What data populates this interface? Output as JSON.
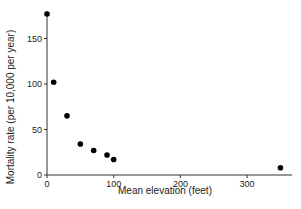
{
  "chart_data": {
    "type": "scatter",
    "title": "",
    "xlabel": "Mean elevation (feet)",
    "ylabel": "Mortality rate (per 10,000 per year)",
    "x": [
      0,
      10,
      30,
      50,
      70,
      90,
      100,
      350
    ],
    "y": [
      177,
      102,
      65,
      34,
      27,
      22,
      17,
      8
    ],
    "xlim": [
      0,
      360
    ],
    "ylim": [
      0,
      180
    ],
    "x_ticks": [
      0,
      100,
      200,
      300
    ],
    "y_ticks": [
      0,
      50,
      100,
      150
    ],
    "grid": false,
    "legend": null,
    "marker_color": "#000000"
  }
}
